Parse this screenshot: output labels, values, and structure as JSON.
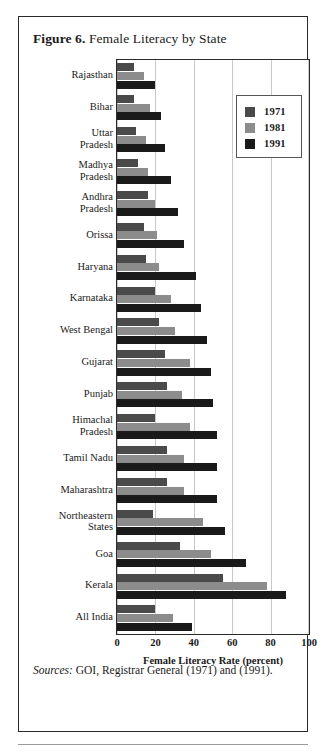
{
  "figure": {
    "number_label": "Figure 6.",
    "title": "Female Literacy by State"
  },
  "sources": {
    "label": "Sources:",
    "text": " GOI, Registrar General (1971) and (1991)."
  },
  "legend": {
    "position": "top-right",
    "entries": [
      {
        "label": "1971",
        "color": "#4a4a4a"
      },
      {
        "label": "1981",
        "color": "#8c8c8c"
      },
      {
        "label": "1991",
        "color": "#1a1a1a"
      }
    ]
  },
  "axis": {
    "x_title": "Female Literacy Rate (percent)",
    "x_ticks": [
      "0",
      "20",
      "40",
      "60",
      "80",
      "100"
    ],
    "x_tick_values": [
      0,
      20,
      40,
      60,
      80,
      100
    ],
    "x_min": 0,
    "x_max": 100
  },
  "chart_data": {
    "type": "bar",
    "orientation": "horizontal",
    "title": "Female Literacy by State",
    "xlabel": "Female Literacy Rate (percent)",
    "ylabel": "",
    "xlim": [
      0,
      100
    ],
    "grid": true,
    "legend_position": "top-right",
    "categories": [
      "Rajasthan",
      "Bihar",
      "Uttar Pradesh",
      "Madhya Pradesh",
      "Andhra Pradesh",
      "Orissa",
      "Haryana",
      "Karnataka",
      "West Bengal",
      "Gujarat",
      "Punjab",
      "Himachal Pradesh",
      "Tamil Nadu",
      "Maharashtra",
      "Northeastern States",
      "Goa",
      "Kerala",
      "All India"
    ],
    "category_lines": [
      [
        "Rajasthan"
      ],
      [
        "Bihar"
      ],
      [
        "Uttar",
        "Pradesh"
      ],
      [
        "Madhya",
        "Pradesh"
      ],
      [
        "Andhra",
        "Pradesh"
      ],
      [
        "Orissa"
      ],
      [
        "Haryana"
      ],
      [
        "Karnataka"
      ],
      [
        "West Bengal"
      ],
      [
        "Gujarat"
      ],
      [
        "Punjab"
      ],
      [
        "Himachal",
        "Pradesh"
      ],
      [
        "Tamil Nadu"
      ],
      [
        "Maharashtra"
      ],
      [
        "Northeastern",
        "States"
      ],
      [
        "Goa"
      ],
      [
        "Kerala"
      ],
      [
        "All India"
      ]
    ],
    "series": [
      {
        "name": "1971",
        "color": "#4a4a4a",
        "values": [
          9,
          9,
          10,
          11,
          16,
          14,
          15,
          20,
          22,
          25,
          26,
          20,
          26,
          26,
          19,
          33,
          55,
          20
        ]
      },
      {
        "name": "1981",
        "color": "#8c8c8c",
        "values": [
          14,
          17,
          15,
          16,
          20,
          21,
          22,
          28,
          30,
          38,
          34,
          38,
          35,
          35,
          45,
          49,
          78,
          29
        ]
      },
      {
        "name": "1991",
        "color": "#1a1a1a",
        "values": [
          20,
          23,
          25,
          28,
          32,
          35,
          41,
          44,
          47,
          49,
          50,
          52,
          52,
          52,
          56,
          67,
          88,
          39
        ]
      }
    ]
  }
}
